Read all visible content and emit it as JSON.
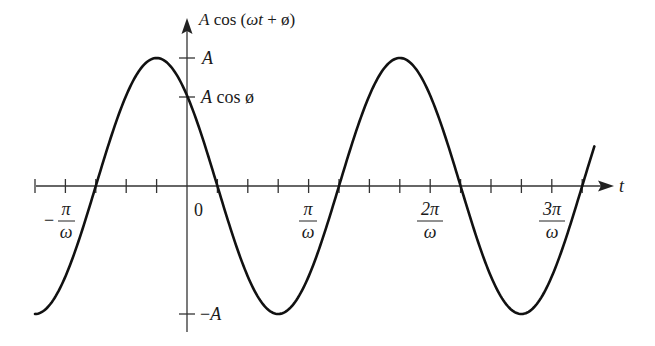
{
  "chart_data": {
    "type": "line",
    "title": "",
    "function": "A cos(ωt + φ)",
    "phase_phi": "π/4",
    "xlabel": "t",
    "ylabel": "A cos (ωt + ø)",
    "x_tick_labels": [
      {
        "label_num": "−π",
        "label_den": "ω",
        "value_over_pi_per_omega": -1
      },
      {
        "label": "0",
        "value_over_pi_per_omega": 0
      },
      {
        "label_num": "π",
        "label_den": "ω",
        "value_over_pi_per_omega": 1
      },
      {
        "label_num": "2π",
        "label_den": "ω",
        "value_over_pi_per_omega": 2
      },
      {
        "label_num": "3π",
        "label_den": "ω",
        "value_over_pi_per_omega": 3
      }
    ],
    "x_minor_ticks_per_pi_over_omega": 4,
    "y_tick_labels": [
      {
        "label": "A",
        "value": 1
      },
      {
        "label": "A cos ø",
        "value": 0.707
      },
      {
        "label": "−A",
        "value": -1
      }
    ],
    "xlim_over_pi_per_omega": [
      -1.25,
      3.35
    ],
    "ylim_over_A": [
      -1,
      1
    ],
    "grid": false,
    "legend": null,
    "key_points": [
      {
        "t_over_pi_per_omega": -1.25,
        "y_over_A": -1,
        "note": "trough"
      },
      {
        "t_over_pi_per_omega": -0.75,
        "y_over_A": 0,
        "note": "zero crossing"
      },
      {
        "t_over_pi_per_omega": -0.25,
        "y_over_A": 1,
        "note": "peak"
      },
      {
        "t_over_pi_per_omega": 0,
        "y_over_A": 0.707,
        "note": "A cos φ"
      },
      {
        "t_over_pi_per_omega": 0.25,
        "y_over_A": 0,
        "note": "zero crossing"
      },
      {
        "t_over_pi_per_omega": 0.75,
        "y_over_A": -1,
        "note": "trough"
      },
      {
        "t_over_pi_per_omega": 1.25,
        "y_over_A": 0,
        "note": "zero crossing"
      },
      {
        "t_over_pi_per_omega": 1.75,
        "y_over_A": 1,
        "note": "peak"
      },
      {
        "t_over_pi_per_omega": 2.25,
        "y_over_A": 0,
        "note": "zero crossing"
      },
      {
        "t_over_pi_per_omega": 2.75,
        "y_over_A": -1,
        "note": "trough"
      },
      {
        "t_over_pi_per_omega": 3.25,
        "y_over_A": 0,
        "note": "zero crossing"
      }
    ]
  },
  "labels": {
    "y_axis_title": "A cos (ωt + ø)",
    "y_A": "A",
    "y_Acos": "A cos ø",
    "y_negA": "−A",
    "x_axis_title": "t",
    "x_zero": "0",
    "x_neg_pi_num": "π",
    "x_neg_sign": "−",
    "x_pi_num": "π",
    "x_2pi_num": "2π",
    "x_3pi_num": "3π",
    "x_den": "ω"
  },
  "style": {
    "curve_color": "#111111",
    "axis_color": "#333333"
  }
}
